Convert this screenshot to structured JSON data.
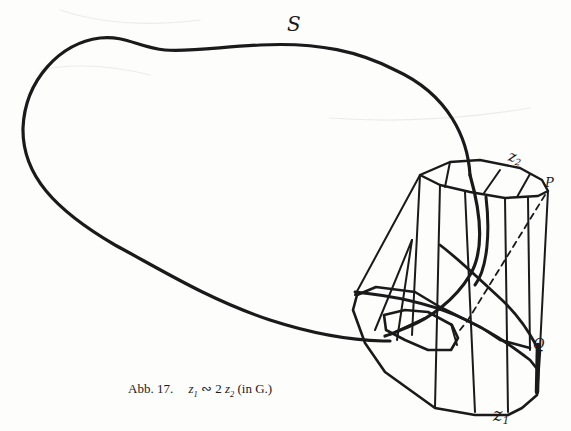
{
  "figure": {
    "labels": {
      "surface": "S",
      "cycle_top_main": "z",
      "cycle_top_sub": "2",
      "point_p": "P",
      "point_q": "Q",
      "cycle_bottom_main": "z",
      "cycle_bottom_sub": "1"
    },
    "caption": {
      "figure_number": "Abb. 17.",
      "z1_main": "z",
      "z1_sub": "1",
      "relation": " ∾ 2 ",
      "z2_main": "z",
      "z2_sub": "2",
      "suffix": " (in G.)"
    },
    "colors": {
      "ink": "#1a1a1a",
      "paper": "#fdfdfc",
      "bleed_through": "#e9e9e6"
    }
  }
}
